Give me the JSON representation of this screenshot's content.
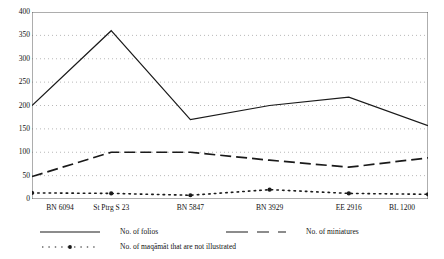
{
  "chart_data": {
    "type": "line",
    "title": "",
    "xlabel": "",
    "ylabel": "",
    "ylim": [
      0,
      400
    ],
    "ytick_step": 50,
    "grid": true,
    "grid_style": "dotted",
    "legend_position": "bottom",
    "categories": [
      "BN 6094",
      "St Ptrg S 23",
      "BN 5847",
      "BN 3929",
      "EE 2916",
      "BL 1200"
    ],
    "yticks": [
      "0",
      "50",
      "100",
      "150",
      "200",
      "250",
      "300",
      "350",
      "400"
    ],
    "series": [
      {
        "name": "No. of folios",
        "style": "solid",
        "color": "#1a1a1a",
        "values": [
          200,
          360,
          170,
          200,
          218,
          157
        ]
      },
      {
        "name": "No. of miniatures",
        "style": "dashed",
        "color": "#1a1a1a",
        "values": [
          48,
          100,
          100,
          83,
          68,
          88
        ]
      },
      {
        "name": "No. of maqāmāt that are not illustrated",
        "style": "dotted",
        "color": "#1a1a1a",
        "values": [
          13,
          12,
          8,
          20,
          12,
          10
        ]
      }
    ]
  },
  "axes": {
    "y_labels": [
      "400",
      "350",
      "300",
      "250",
      "200",
      "150",
      "100",
      "50",
      "0"
    ],
    "x_labels": [
      "BN 6094",
      "St Ptrg S 23",
      "BN 5847",
      "BN 3929",
      "EE 2916",
      "BL 1200"
    ]
  },
  "legend": {
    "folios": "No. of folios",
    "miniatures": "No. of miniatures",
    "maqamat": "No. of maqāmāt that are not illustrated"
  },
  "colors": {
    "line": "#1a1a1a",
    "grid": "#9a9a9a",
    "axis": "#4a4a4a",
    "background": "#ffffff"
  }
}
